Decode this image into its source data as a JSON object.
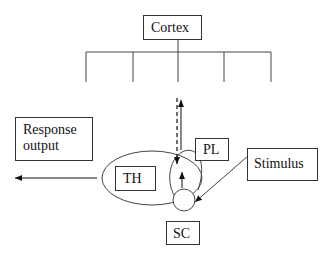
{
  "diagram": {
    "nodes": {
      "cortex": "Cortex",
      "response_output_line1": "Response",
      "response_output_line2": "output",
      "pl": "PL",
      "th": "TH",
      "stimulus": "Stimulus",
      "sc": "SC"
    },
    "edges": [
      {
        "from": "stimulus",
        "to": "sc",
        "style": "solid-arrow"
      },
      {
        "from": "sc",
        "to": "pl",
        "style": "solid-arrow"
      },
      {
        "from": "cortex",
        "to": "pl",
        "style": "dashed-arrow"
      },
      {
        "from": "pl",
        "to": "cortex",
        "style": "solid-arrow"
      },
      {
        "from": "th",
        "to": "response_output",
        "style": "solid-arrow"
      }
    ]
  }
}
